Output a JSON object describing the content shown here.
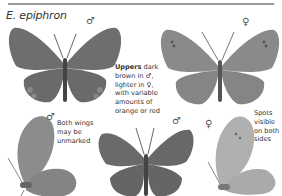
{
  "header": {
    "title": "E. epiphron"
  },
  "symbols": {
    "male": "♂",
    "female": "♀"
  },
  "figures": [
    {
      "id": "upper-male",
      "view": "upperside",
      "sex": "male",
      "sex_symbol": "♂"
    },
    {
      "id": "upper-female",
      "view": "upperside",
      "sex": "female",
      "sex_symbol": "♀"
    },
    {
      "id": "under-male",
      "view": "underside",
      "sex": "male",
      "sex_symbol": "♂"
    },
    {
      "id": "upper-male-2",
      "view": "upperside",
      "sex": "male",
      "sex_symbol": "♂"
    },
    {
      "id": "under-female",
      "view": "underside",
      "sex": "female",
      "sex_symbol": "♀"
    }
  ],
  "notes": {
    "uppers_bold": "Uppers",
    "uppers_line1": " dark",
    "uppers_line2": "brown in ♂,",
    "uppers_line3": "lighter in ♀,",
    "uppers_line4": "with variable",
    "uppers_line5": "amounts of",
    "uppers_line6": "orange or red",
    "both_line1": "Both wings",
    "both_line2": "may be",
    "both_line3": "unmarked",
    "spots_line1": "Spots",
    "spots_line2": "visible",
    "spots_line3": "on both",
    "spots_line4": "sides"
  },
  "colors": {
    "male_wing": "#6e6e6e",
    "female_wing": "#8a8a8a",
    "under_male": "#8c8c8c",
    "under_female": "#b0b0b0",
    "rule": "#9a9a9a"
  }
}
